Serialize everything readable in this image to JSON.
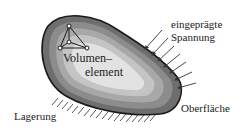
{
  "diagram": {
    "labels": {
      "volume_element_line1": "Volumen–",
      "volume_element_line2": "element",
      "imposed_stress_line1": "eingeprägte",
      "imposed_stress_line2": "Spannung",
      "surface": "Oberfläche",
      "support": "Lagerung"
    },
    "colors": {
      "outline": "#1a1a1a",
      "shade_outer": "#6e6e6e",
      "shade_mid1": "#8c8c8c",
      "shade_mid2": "#a8a8a8",
      "shade_mid3": "#c4c4c4",
      "shade_inner": "#e2e2e2",
      "arrows": "#333333",
      "hatch": "#555555"
    },
    "arrow_count": 7,
    "hatch_count": 18
  }
}
